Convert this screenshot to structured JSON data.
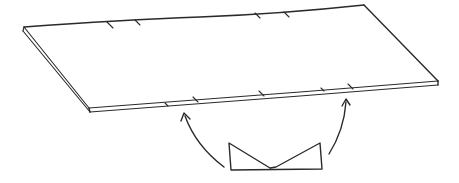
{
  "diagram": {
    "stroke_color": "#2a2a2a",
    "background": "#ffffff",
    "board": {
      "corners": {
        "top_left": [
          24,
          28
        ],
        "top_right": [
          364,
          5
        ],
        "bottom_right": [
          438,
          82
        ],
        "bottom_left": [
          91,
          110
        ]
      },
      "top_edge_ticks_x": [
        109,
        137,
        257,
        286
      ],
      "front_edge_ticks_x": [
        166,
        194,
        261,
        322,
        350
      ]
    },
    "support_shape": {
      "label": "",
      "points": [
        [
          229,
          143
        ],
        [
          231,
          170
        ],
        [
          322,
          169
        ],
        [
          320,
          143
        ],
        [
          275,
          168
        ]
      ]
    },
    "arrows": [
      {
        "name": "left-arrow",
        "from": [
          224,
          168
        ],
        "to": [
          184,
          113
        ]
      },
      {
        "name": "right-arrow",
        "from": [
          328,
          154
        ],
        "to": [
          346,
          99
        ]
      }
    ]
  }
}
